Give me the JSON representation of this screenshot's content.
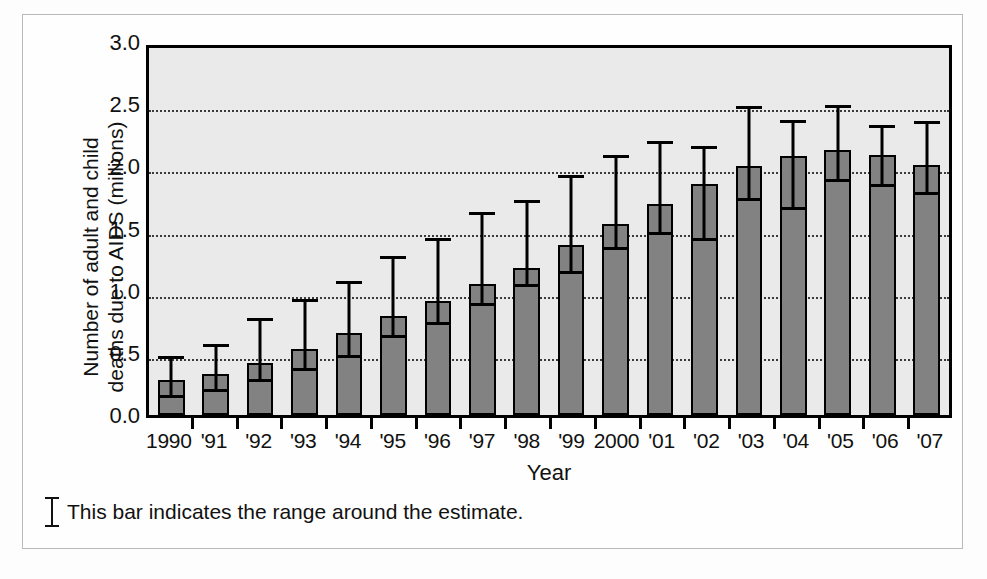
{
  "chart_data": {
    "type": "bar",
    "title": "",
    "xlabel": "Year",
    "ylabel": "Number of adult and child deaths due to AIDS (millions)",
    "ylabel_line1": "Number of adult and child",
    "ylabel_line2": "deaths due to AIDS (millions)",
    "ylim": [
      0,
      3.0
    ],
    "ytick_labels": [
      "3.0",
      "2.5",
      "2.0",
      "1.5",
      "1.0",
      "0.5",
      "0.0"
    ],
    "ytick_values": [
      3.0,
      2.5,
      2.0,
      1.5,
      1.0,
      0.5,
      0.0
    ],
    "grid": "horizontal-dotted",
    "legend_position": "below-plot",
    "categories": [
      "1990",
      "'91",
      "'92",
      "'93",
      "'94",
      "'95",
      "'96",
      "'97",
      "'98",
      "'99",
      "2000",
      "'01",
      "'02",
      "'03",
      "'04",
      "'05",
      "'06",
      "'07"
    ],
    "values": [
      0.28,
      0.33,
      0.42,
      0.53,
      0.66,
      0.8,
      0.92,
      1.05,
      1.18,
      1.37,
      1.54,
      1.7,
      1.86,
      2.0,
      2.08,
      2.13,
      2.09,
      2.01
    ],
    "error_low": [
      0.21,
      0.26,
      0.34,
      0.43,
      0.53,
      0.69,
      0.8,
      0.95,
      1.1,
      1.21,
      1.4,
      1.52,
      1.47,
      1.79,
      1.72,
      1.95,
      1.91,
      1.84
    ],
    "error_high": [
      0.52,
      0.62,
      0.83,
      0.98,
      1.13,
      1.33,
      1.47,
      1.68,
      1.78,
      1.98,
      2.14,
      2.25,
      2.21,
      2.53,
      2.42,
      2.54,
      2.38,
      2.41
    ],
    "bar_color": "#828282",
    "bar_edge_color": "#000000",
    "plot_background": "#eaeaea",
    "error_bar_color": "#000000"
  },
  "footnote": {
    "symbol": "error-bar-icon",
    "text": "This bar indicates the range around the estimate."
  }
}
